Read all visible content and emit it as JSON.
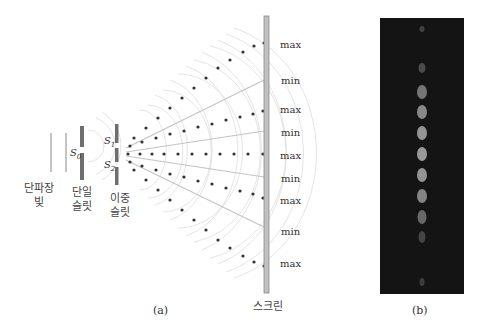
{
  "figure_a": {
    "caption": "(a)",
    "source_label_line1": "단파장",
    "source_label_line2": "빛",
    "single_slit_label_line1": "단일",
    "single_slit_label_line2": "슬릿",
    "double_slit_label_line1": "이중",
    "double_slit_label_line2": "슬릿",
    "screen_label": "스크린",
    "s0_label": "S",
    "s0_sub": "0",
    "s1_label": "S",
    "s1_sub": "1",
    "s2_label": "S",
    "s2_sub": "2",
    "screen_marks": [
      "max",
      "min",
      "max",
      "min",
      "max",
      "min",
      "max",
      "min",
      "max"
    ]
  },
  "figure_b": {
    "caption": "(b)"
  },
  "colors": {
    "slit": "#6e6e6e",
    "screen": "#bdbdbd",
    "dot": "#333333",
    "wave": "#cfcfcf",
    "line": "#bdbdbd",
    "photo_bg": "#141414"
  }
}
